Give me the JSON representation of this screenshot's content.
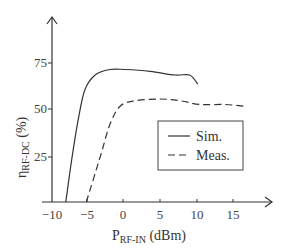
{
  "chart_data": {
    "type": "line",
    "title": "",
    "xlabel": "P_RF-IN (dBm)",
    "xlabel_main": "P",
    "xlabel_sub": "RF-IN",
    "xlabel_unit": " (dBm)",
    "ylabel": "η_RF-DC (%)",
    "ylabel_main": "η",
    "ylabel_sub": "RF-DC",
    "ylabel_unit": " (%)",
    "xlim": [
      -10,
      19
    ],
    "ylim": [
      0,
      85
    ],
    "x_ticks": [
      "-10",
      "-5",
      "0",
      "5",
      "10",
      "15"
    ],
    "y_ticks": [
      "25",
      "50",
      "75"
    ],
    "grid": false,
    "legend_position": "right-center",
    "series": [
      {
        "name": "Sim.",
        "style": "solid",
        "x": [
          -7.8,
          -7,
          -6.1,
          -5.2,
          -3.8,
          -1.8,
          0.3,
          3.7,
          7.1,
          9.1,
          10.2
        ],
        "y": [
          0,
          23,
          45,
          61,
          69,
          72,
          72,
          71,
          69,
          69,
          64
        ]
      },
      {
        "name": "Meas.",
        "style": "dashed",
        "x": [
          -5,
          -3,
          -1.8,
          -0.4,
          1.6,
          5,
          7.8,
          10.5,
          13.9,
          16.6
        ],
        "y": [
          0,
          26,
          42,
          52,
          55,
          56,
          55,
          53,
          53,
          52
        ]
      }
    ]
  },
  "legend": {
    "items": [
      "Sim.",
      "Meas."
    ]
  },
  "axes": {
    "x_ticks": [
      "−10",
      "−5",
      "0",
      "5",
      "10",
      "15"
    ],
    "y_ticks": [
      "75",
      "50",
      "25"
    ],
    "xlabel_main": "P",
    "xlabel_sub": "RF-IN",
    "xlabel_unit": " (dBm)",
    "ylabel_main": "η",
    "ylabel_sub": "RF-DC",
    "ylabel_unit": " (%)"
  }
}
